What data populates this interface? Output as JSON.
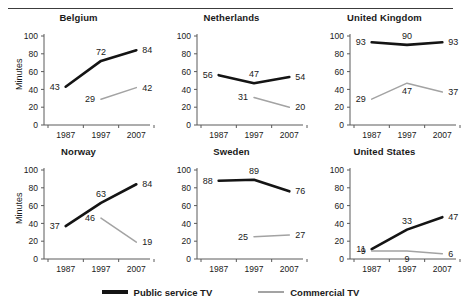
{
  "figure": {
    "ylabel": "Minutes",
    "legend": [
      {
        "name": "public",
        "label": "Public service TV",
        "color": "#141414"
      },
      {
        "name": "commercial",
        "label": "Commercial TV",
        "color": "#a3a3a3"
      }
    ]
  },
  "chart_data": {
    "type": "line",
    "title": "",
    "xlabel": "",
    "ylabel": "Minutes",
    "ylim": [
      0,
      100
    ],
    "yticks": [
      0,
      20,
      40,
      60,
      80,
      100
    ],
    "x": [
      1987,
      1997,
      2007
    ],
    "xticklabels": [
      "1987",
      "1997",
      "2007"
    ],
    "grid": false,
    "legend_position": "bottom-center",
    "legend_entries": [
      "Public service TV",
      "Commercial TV"
    ],
    "panels": [
      {
        "title": "Belgium",
        "series": [
          {
            "name": "Public service TV",
            "color": "#141414",
            "x": [
              1987,
              1997,
              2007
            ],
            "values": [
              43,
              72,
              84
            ],
            "labels": [
              "43",
              "72",
              "84"
            ]
          },
          {
            "name": "Commercial TV",
            "color": "#a3a3a3",
            "x": [
              1997,
              2007
            ],
            "values": [
              29,
              42
            ],
            "labels": [
              "29",
              "42"
            ]
          }
        ]
      },
      {
        "title": "Netherlands",
        "series": [
          {
            "name": "Public service TV",
            "color": "#141414",
            "x": [
              1987,
              1997,
              2007
            ],
            "values": [
              56,
              47,
              54
            ],
            "labels": [
              "56",
              "47",
              "54"
            ]
          },
          {
            "name": "Commercial TV",
            "color": "#a3a3a3",
            "x": [
              1997,
              2007
            ],
            "values": [
              31,
              20
            ],
            "labels": [
              "31",
              "20"
            ]
          }
        ]
      },
      {
        "title": "United Kingdom",
        "series": [
          {
            "name": "Public service TV",
            "color": "#141414",
            "x": [
              1987,
              1997,
              2007
            ],
            "values": [
              93,
              90,
              93
            ],
            "labels": [
              "93",
              "90",
              "93"
            ]
          },
          {
            "name": "Commercial TV",
            "color": "#a3a3a3",
            "x": [
              1987,
              1997,
              2007
            ],
            "values": [
              29,
              47,
              37
            ],
            "labels": [
              "29",
              "47",
              "37"
            ]
          }
        ]
      },
      {
        "title": "Norway",
        "series": [
          {
            "name": "Public service TV",
            "color": "#141414",
            "x": [
              1987,
              1997,
              2007
            ],
            "values": [
              37,
              63,
              84
            ],
            "labels": [
              "37",
              "63",
              "84"
            ]
          },
          {
            "name": "Commercial TV",
            "color": "#a3a3a3",
            "x": [
              1997,
              2007
            ],
            "values": [
              46,
              19
            ],
            "labels": [
              "46",
              "19"
            ]
          }
        ]
      },
      {
        "title": "Sweden",
        "series": [
          {
            "name": "Public service TV",
            "color": "#141414",
            "x": [
              1987,
              1997,
              2007
            ],
            "values": [
              88,
              89,
              76
            ],
            "labels": [
              "88",
              "89",
              "76"
            ]
          },
          {
            "name": "Commercial TV",
            "color": "#a3a3a3",
            "x": [
              1997,
              2007
            ],
            "values": [
              25,
              27
            ],
            "labels": [
              "25",
              "27"
            ]
          }
        ]
      },
      {
        "title": "United States",
        "series": [
          {
            "name": "Public service TV",
            "color": "#141414",
            "x": [
              1987,
              1997,
              2007
            ],
            "values": [
              11,
              33,
              47
            ],
            "labels": [
              "11",
              "33",
              "47"
            ]
          },
          {
            "name": "Commercial TV",
            "color": "#a3a3a3",
            "x": [
              1987,
              1997,
              2007
            ],
            "values": [
              9,
              9,
              6
            ],
            "labels": [
              "9",
              "9",
              "6"
            ]
          }
        ]
      }
    ]
  }
}
